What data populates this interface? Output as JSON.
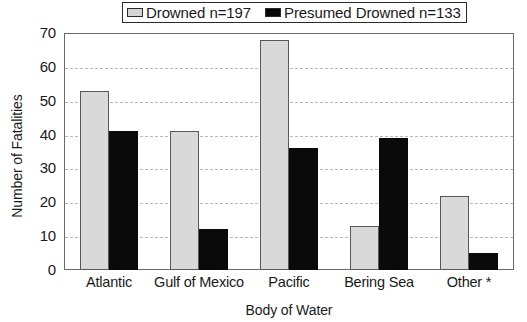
{
  "chart_data": {
    "type": "bar",
    "title": "",
    "xlabel": "Body of Water",
    "ylabel": "Number of Fatalities",
    "categories": [
      "Atlantic",
      "Gulf of Mexico",
      "Pacific",
      "Bering Sea",
      "Other *"
    ],
    "series": [
      {
        "name": "Drowned n=197",
        "values": [
          53,
          41,
          68,
          13,
          22
        ],
        "color": "#d9d9d9"
      },
      {
        "name": "Presumed Drowned n=133",
        "values": [
          41,
          12,
          36,
          39,
          5
        ],
        "color": "#0a0a0a"
      }
    ],
    "ylim": [
      0,
      70
    ],
    "yticks": [
      0,
      10,
      20,
      30,
      40,
      50,
      60,
      70
    ],
    "grid": true,
    "legend_position": "top-center"
  },
  "legend": {
    "entries": [
      {
        "label": "Drowned n=197",
        "swatch": "light-gray-swatch"
      },
      {
        "label": "Presumed Drowned n=133",
        "swatch": "black-swatch"
      }
    ]
  },
  "axes": {
    "y_title": "Number of Fatalities",
    "x_title": "Body of Water"
  }
}
